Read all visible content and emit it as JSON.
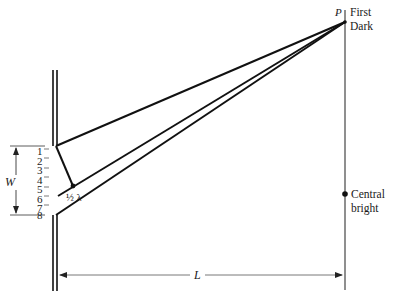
{
  "diagram": {
    "type": "single-slit diffraction geometry",
    "labels": {
      "point": "P",
      "first_dark_line1": "First",
      "first_dark_line2": "Dark",
      "central_line1": "Central",
      "central_line2": "bright",
      "width": "W",
      "distance": "L",
      "path_difference": "½ λ"
    },
    "slit_sources": [
      "1",
      "2",
      "3",
      "4",
      "5",
      "6",
      "7",
      "8"
    ],
    "colors": {
      "line": "#111111",
      "arrow": "#555555",
      "background": "#ffffff"
    }
  }
}
